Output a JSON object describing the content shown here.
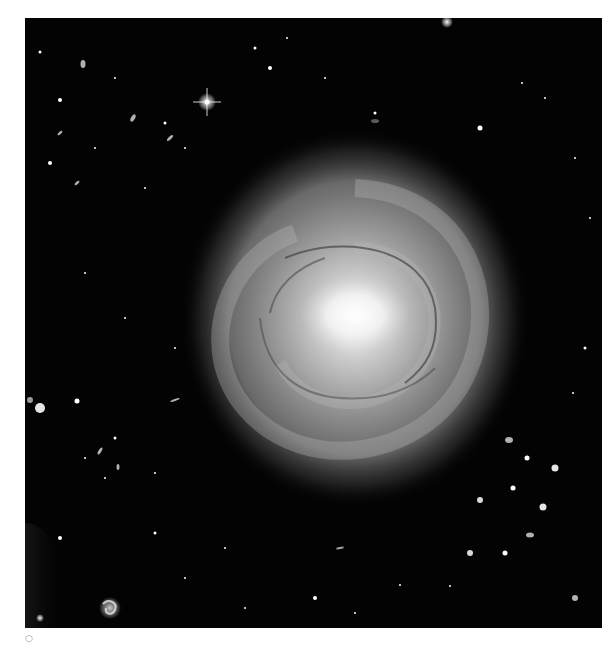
{
  "figure": {
    "caption_mark": "○",
    "colors": {
      "background_page": "#ffffff",
      "sky": "#030303",
      "core": "#ffffff",
      "disk": "#9a9a9a"
    },
    "features": [
      {
        "name": "galaxy-core",
        "x": 355,
        "y": 315
      },
      {
        "name": "bright-star-diffraction",
        "x": 207,
        "y": 102
      },
      {
        "name": "small-spiral-galaxy",
        "x": 110,
        "y": 608
      },
      {
        "name": "edge-glow-bottom-left",
        "x": 25,
        "y": 590
      }
    ]
  }
}
